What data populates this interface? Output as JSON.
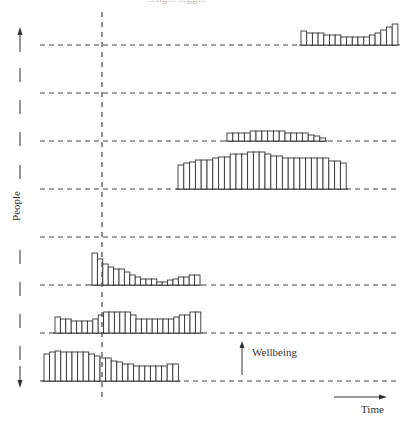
{
  "labels": {
    "y_axis": "People",
    "x_axis": "Time",
    "bar_scale": "Wellbeing",
    "top_fragment": "...ng... ...gg..."
  },
  "colors": {
    "line": "#333333",
    "dash": "#444444",
    "background": "#ffffff"
  },
  "layout": {
    "baseline_start_x": 40,
    "baseline_end_x": 398,
    "marker_x": 102,
    "baselines_y": [
      45,
      93,
      141,
      189,
      237,
      285,
      333,
      381
    ]
  },
  "chart_data": {
    "type": "bar",
    "title": "",
    "xlabel": "Time",
    "ylabel": "People",
    "annotations": [
      "Wellbeing (vertical arrow)",
      "Time (horizontal arrow)",
      "Dashed vertical time marker"
    ],
    "grid": false,
    "rows": [
      {
        "person": 1,
        "baseline_y": 45,
        "x_start": 301,
        "bar_width": 5.7,
        "values": [
          14,
          12,
          12,
          12,
          10,
          10,
          10,
          8,
          8,
          8,
          8,
          8,
          10,
          12,
          15,
          18,
          21
        ]
      },
      {
        "person": 2,
        "baseline_y": 93,
        "x_start": null,
        "bar_width": null,
        "values": []
      },
      {
        "person": 3,
        "baseline_y": 141,
        "x_start": 227,
        "bar_width": 5.8,
        "values": [
          8,
          8,
          8,
          8,
          10,
          10,
          10,
          10,
          10,
          10,
          8,
          8,
          8,
          8,
          6,
          5,
          3
        ]
      },
      {
        "person": 4,
        "baseline_y": 189,
        "x_start": 178,
        "bar_width": 5.8,
        "values": [
          24,
          26,
          27,
          29,
          29,
          29,
          31,
          32,
          32,
          35,
          35,
          35,
          37,
          37,
          37,
          35,
          33,
          33,
          31,
          31,
          31,
          31,
          31,
          31,
          31,
          31,
          28,
          28,
          26
        ]
      },
      {
        "person": 5,
        "baseline_y": 237,
        "x_start": null,
        "bar_width": null,
        "values": []
      },
      {
        "person": 6,
        "baseline_y": 285,
        "x_start": 92,
        "bar_width": 5.4,
        "values": [
          32,
          26,
          21,
          18,
          16,
          16,
          13,
          10,
          8,
          6,
          6,
          6,
          3,
          3,
          5,
          6,
          8,
          8,
          10,
          10
        ]
      },
      {
        "person": 7,
        "baseline_y": 333,
        "x_start": 55,
        "bar_width": 5.4,
        "values": [
          16,
          14,
          14,
          12,
          12,
          12,
          12,
          14,
          18,
          21,
          21,
          21,
          21,
          21,
          18,
          14,
          14,
          14,
          14,
          14,
          14,
          14,
          16,
          18,
          18,
          21,
          21
        ]
      },
      {
        "person": 8,
        "baseline_y": 381,
        "x_start": 44,
        "bar_width": 5.6,
        "values": [
          27,
          29,
          30,
          29,
          29,
          29,
          29,
          29,
          27,
          25,
          23,
          23,
          20,
          19,
          17,
          17,
          15,
          15,
          15,
          15,
          15,
          15,
          17,
          17
        ]
      }
    ]
  }
}
